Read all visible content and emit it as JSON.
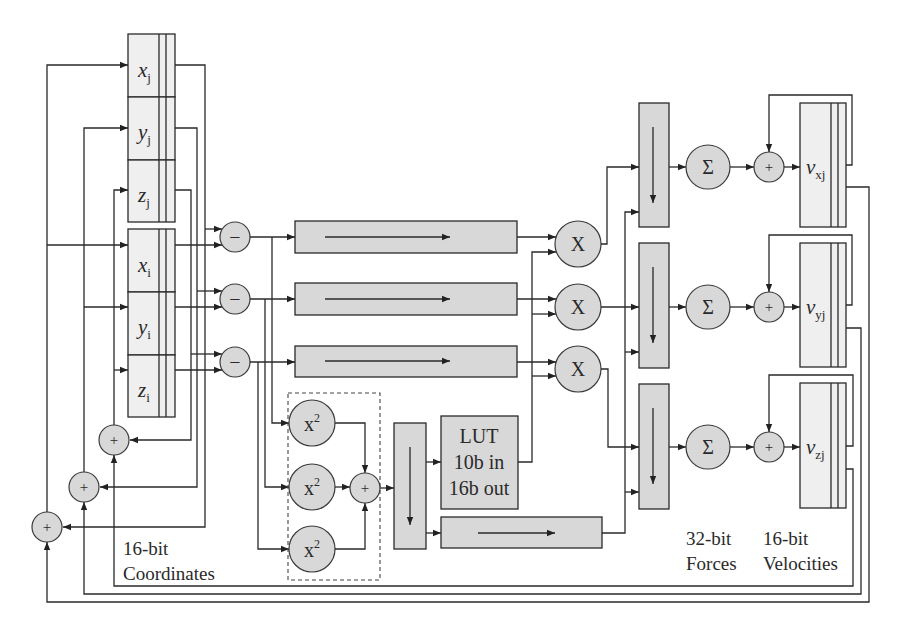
{
  "diagram": {
    "coordinate_registers": [
      {
        "var": "x",
        "sub": "j"
      },
      {
        "var": "y",
        "sub": "j"
      },
      {
        "var": "z",
        "sub": "j"
      },
      {
        "var": "x",
        "sub": "i"
      },
      {
        "var": "y",
        "sub": "i"
      },
      {
        "var": "z",
        "sub": "i"
      }
    ],
    "velocity_registers": [
      {
        "var": "v",
        "sub": "xj"
      },
      {
        "var": "v",
        "sub": "yj"
      },
      {
        "var": "v",
        "sub": "zj"
      }
    ],
    "operators": {
      "subtract": "−",
      "multiply": "X",
      "sum": "Σ",
      "add": "+",
      "square_base": "x",
      "square_exp": "2"
    },
    "lut": {
      "line1": "LUT",
      "line2": "10b in",
      "line3": "16b out"
    },
    "labels": {
      "coordinates": {
        "line1": "16-bit",
        "line2": "Coordinates"
      },
      "forces": {
        "line1": "32-bit",
        "line2": "Forces"
      },
      "velocities": {
        "line1": "16-bit",
        "line2": "Velocities"
      }
    },
    "colors": {
      "block_fill": "#d8d8d8",
      "register_fill": "#efefef",
      "stroke": "#2a2a2a"
    }
  }
}
